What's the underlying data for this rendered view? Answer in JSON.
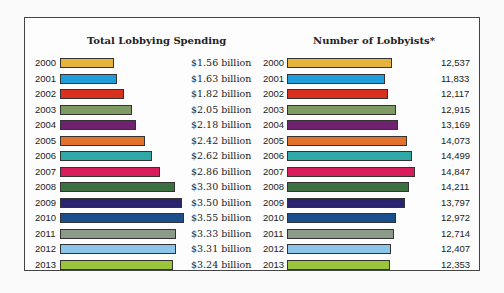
{
  "chart_data": [
    {
      "type": "bar",
      "orientation": "horizontal",
      "title": "Total Lobbying Spending",
      "categories": [
        "2000",
        "2001",
        "2002",
        "2003",
        "2004",
        "2005",
        "2006",
        "2007",
        "2008",
        "2009",
        "2010",
        "2011",
        "2012",
        "2013"
      ],
      "values": [
        1.56,
        1.63,
        1.82,
        2.05,
        2.18,
        2.42,
        2.62,
        2.86,
        3.3,
        3.5,
        3.55,
        3.33,
        3.31,
        3.24
      ],
      "value_labels": [
        "$1.56 billion",
        "$1.63 billion",
        "$1.82 billion",
        "$2.05 billion",
        "$2.18 billion",
        "$2.42 billion",
        "$2.62 billion",
        "$2.86 billion",
        "$3.30 billion",
        "$3.50 billion",
        "$3.55 billion",
        "$3.33 billion",
        "$3.31 billion",
        "$3.24 billion"
      ],
      "unit": "billion USD",
      "xlabel": "",
      "ylabel": "",
      "grid": false
    },
    {
      "type": "bar",
      "orientation": "horizontal",
      "title": "Number of Lobbyists*",
      "categories": [
        "2000",
        "2001",
        "2002",
        "2003",
        "2004",
        "2005",
        "2006",
        "2007",
        "2008",
        "2009",
        "2010",
        "2011",
        "2012",
        "2013"
      ],
      "values": [
        12537,
        11833,
        12117,
        12915,
        13169,
        14073,
        14499,
        14847,
        14211,
        13797,
        12972,
        12714,
        12407,
        12353
      ],
      "value_labels": [
        "12,537",
        "11,833",
        "12,117",
        "12,915",
        "13,169",
        "14,073",
        "14,499",
        "14,847",
        "14,211",
        "13,797",
        "12,972",
        "12,714",
        "12,407",
        "12,353"
      ],
      "xlabel": "",
      "ylabel": "",
      "grid": false
    }
  ],
  "colors": [
    "#e6b43c",
    "#1e9fdc",
    "#d8321e",
    "#7f9a62",
    "#6e2270",
    "#e0702a",
    "#2fa8a6",
    "#d91c5c",
    "#3c7040",
    "#2a2470",
    "#1a4f8c",
    "#8c9a8a",
    "#8cc4ea",
    "#9ac43a"
  ],
  "scales": {
    "left_max": 3.55,
    "left_max_px": 124,
    "right_max": 14847,
    "right_max_px": 128
  }
}
